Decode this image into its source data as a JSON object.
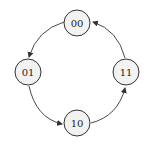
{
  "diagram": {
    "type": "state-transition-cycle",
    "nodes": [
      {
        "id": "n00",
        "label": "00",
        "cx": 77,
        "cy": 23
      },
      {
        "id": "n01",
        "label": "01",
        "cx": 28,
        "cy": 72
      },
      {
        "id": "n10",
        "label": "10",
        "cx": 77,
        "cy": 123
      },
      {
        "id": "n11",
        "label": "11",
        "cx": 126,
        "cy": 72
      }
    ],
    "edges": [
      {
        "from": "00",
        "to": "01"
      },
      {
        "from": "01",
        "to": "10"
      },
      {
        "from": "10",
        "to": "11"
      },
      {
        "from": "11",
        "to": "00"
      }
    ],
    "colors": {
      "node_fill": "#f2f2f2",
      "stroke": "#333333",
      "text": "#222222"
    }
  }
}
